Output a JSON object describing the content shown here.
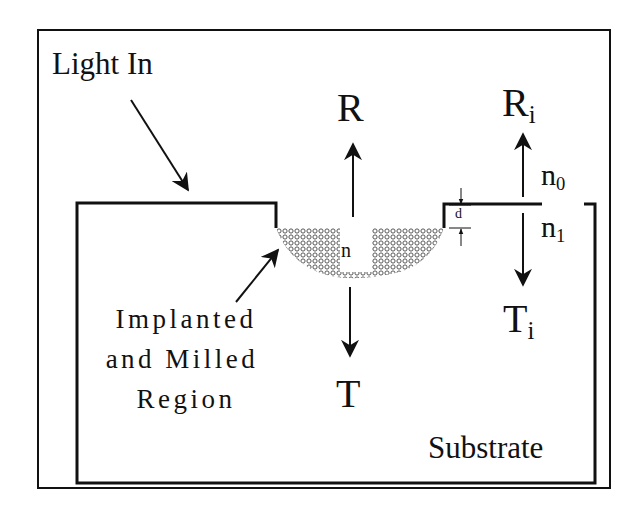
{
  "figure": {
    "type": "cross-section schematic",
    "colors": {
      "stroke": "#111111",
      "background": "#ffffff",
      "hatch": "#555555"
    }
  },
  "labels": {
    "light_in": "Light In",
    "reflected": "R",
    "transmitted": "T",
    "pit_index": "n",
    "depth": "d",
    "reflected_interface": {
      "base": "R",
      "sub": "i"
    },
    "transmitted_interface": {
      "base": "T",
      "sub": "i"
    },
    "index_above": {
      "base": "n",
      "sub": "0"
    },
    "index_below": {
      "base": "n",
      "sub": "1"
    },
    "region_lines": [
      "Implanted",
      "and Milled",
      "Region"
    ],
    "substrate": "Substrate"
  },
  "arrows": [
    {
      "name": "light-in-arrow",
      "direction": "down-right"
    },
    {
      "name": "reflected-arrow",
      "direction": "up"
    },
    {
      "name": "transmitted-arrow",
      "direction": "down"
    },
    {
      "name": "interface-reflected-arrow",
      "direction": "up"
    },
    {
      "name": "interface-transmitted-arrow",
      "direction": "down"
    },
    {
      "name": "region-pointer-arrow",
      "direction": "up-right"
    },
    {
      "name": "depth-arrows",
      "direction": "inward"
    }
  ]
}
